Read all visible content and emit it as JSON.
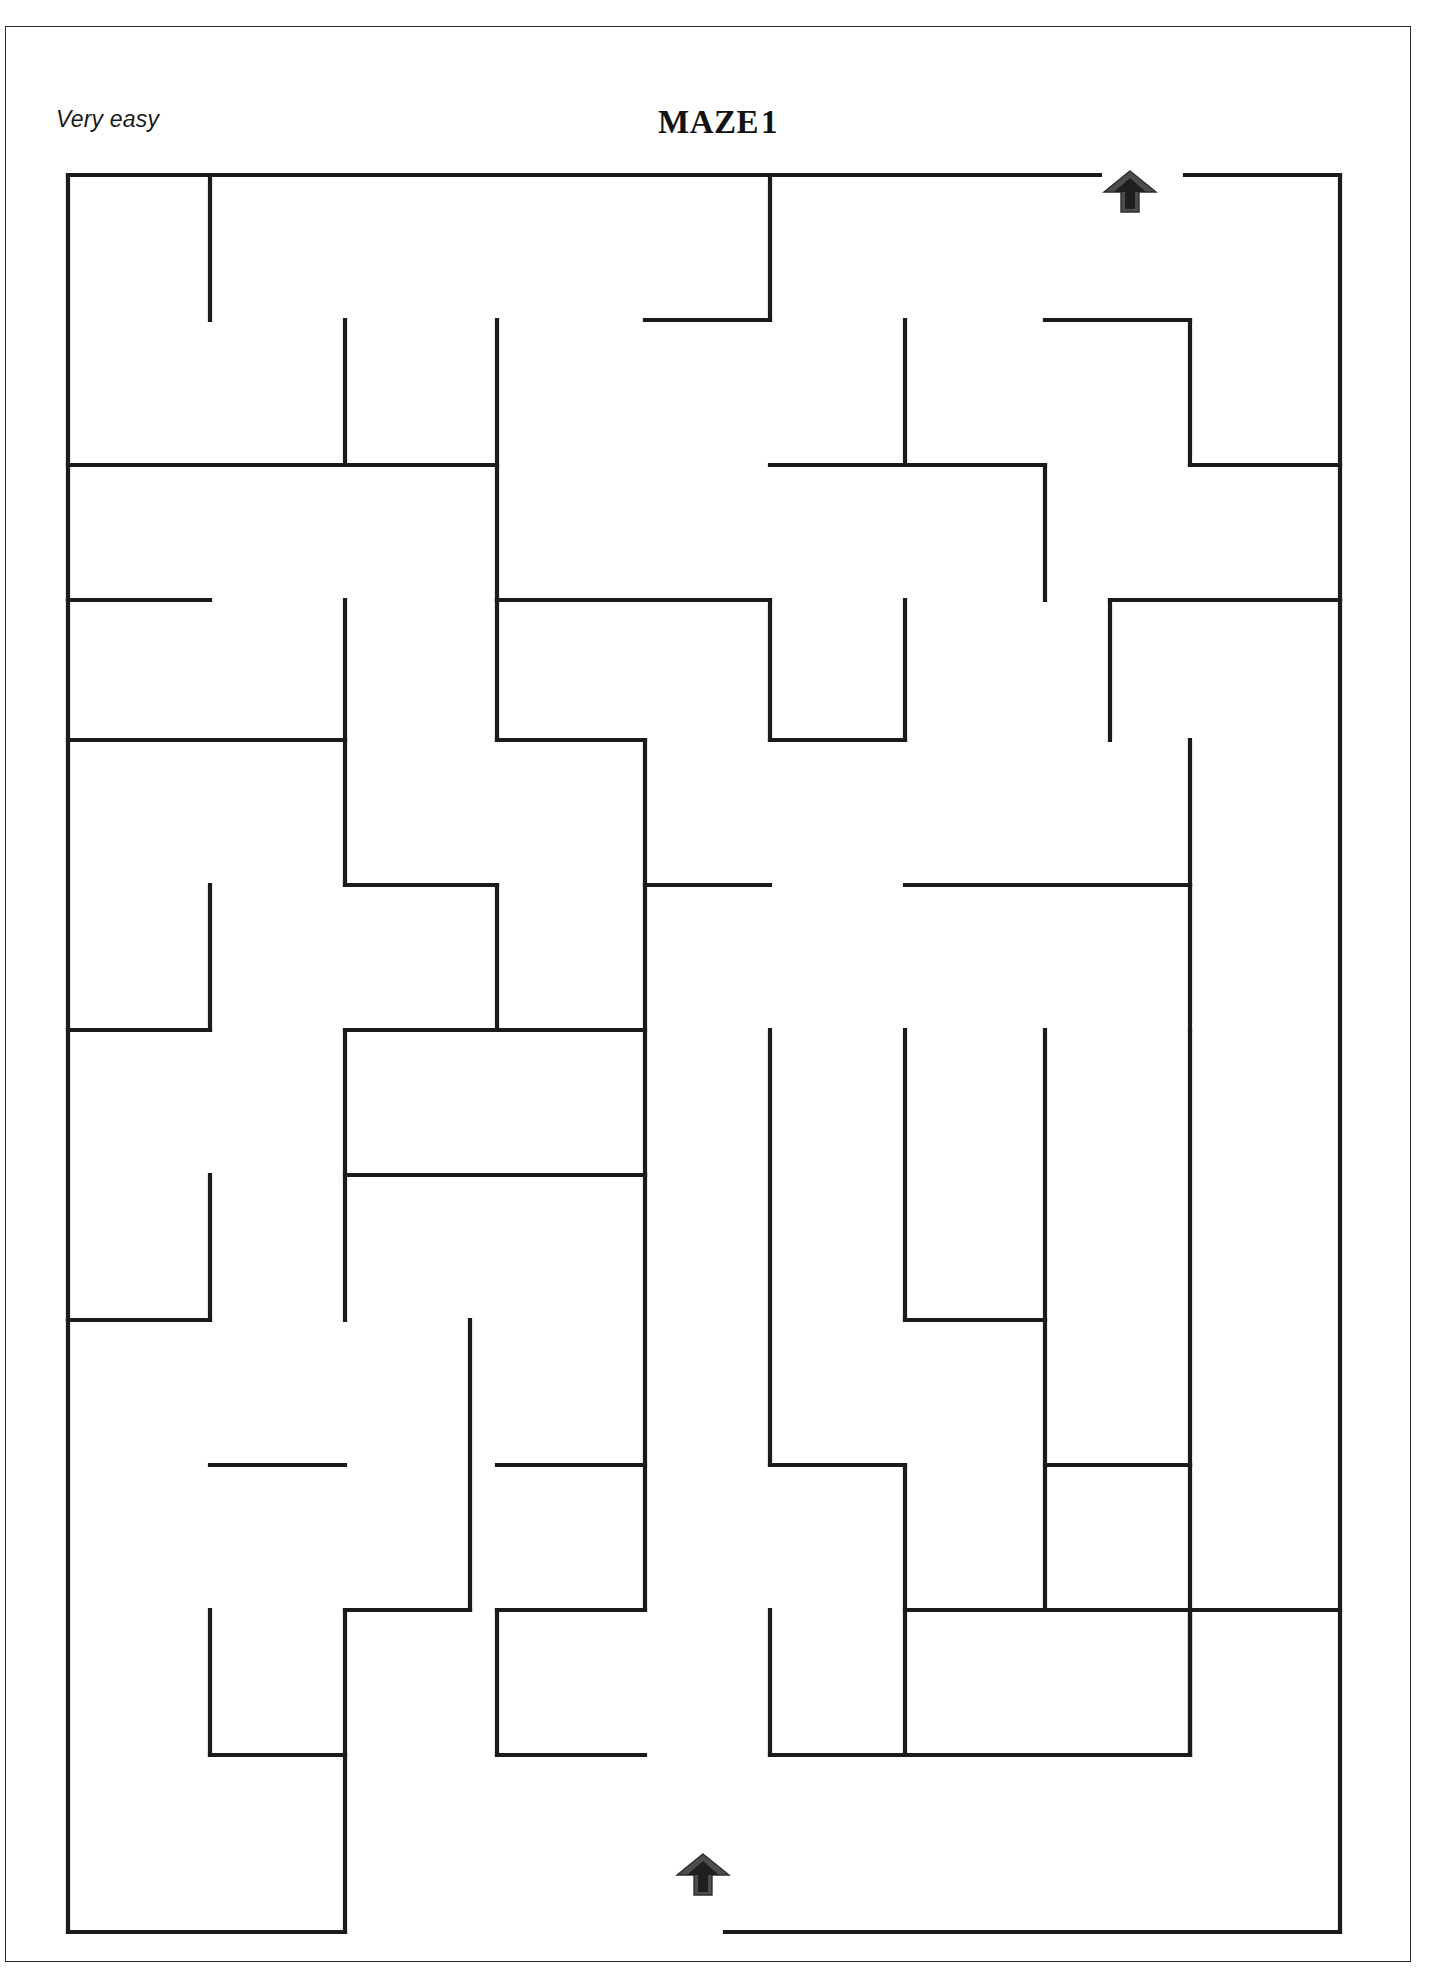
{
  "page": {
    "title": "MAZE",
    "title_number": "1",
    "difficulty": "Very easy",
    "background_color": "#ffffff",
    "frame_color": "#2b2b2b"
  },
  "maze": {
    "name": "maze-grid",
    "wall_color": "#1b1b1b",
    "grid_columns": 17,
    "grid_rows": 23,
    "bounds": {
      "x": 68,
      "y": 175,
      "width": 1272,
      "height": 1757
    },
    "entrance": {
      "name": "maze-entrance-arrow",
      "label": "entrance",
      "x": 1130,
      "y": 192,
      "direction": "up",
      "color": "#4d4d4d"
    },
    "exit": {
      "name": "maze-exit-arrow",
      "label": "exit",
      "x": 703,
      "y": 1875,
      "direction": "up",
      "color": "#4d4d4d"
    },
    "walls": [
      [
        68,
        175,
        68,
        1932
      ],
      [
        1340,
        175,
        1340,
        1932
      ],
      [
        68,
        175,
        1100,
        175
      ],
      [
        1185,
        175,
        1340,
        175
      ],
      [
        68,
        1932,
        345,
        1932
      ],
      [
        725,
        1932,
        1340,
        1932
      ],
      [
        210,
        175,
        210,
        320
      ],
      [
        770,
        175,
        770,
        320
      ],
      [
        645,
        320,
        770,
        320
      ],
      [
        497,
        320,
        497,
        600
      ],
      [
        345,
        320,
        345,
        465
      ],
      [
        68,
        465,
        497,
        465
      ],
      [
        905,
        320,
        905,
        465
      ],
      [
        770,
        465,
        1045,
        465
      ],
      [
        1045,
        465,
        1045,
        600
      ],
      [
        1045,
        320,
        1190,
        320
      ],
      [
        1190,
        320,
        1190,
        465
      ],
      [
        1190,
        465,
        1340,
        465
      ],
      [
        68,
        600,
        210,
        600
      ],
      [
        497,
        600,
        770,
        600
      ],
      [
        1110,
        600,
        1340,
        600
      ],
      [
        1110,
        600,
        1110,
        740
      ],
      [
        345,
        600,
        345,
        740
      ],
      [
        497,
        600,
        497,
        740
      ],
      [
        770,
        600,
        770,
        740
      ],
      [
        905,
        600,
        905,
        740
      ],
      [
        497,
        740,
        645,
        740
      ],
      [
        770,
        740,
        905,
        740
      ],
      [
        68,
        740,
        345,
        740
      ],
      [
        345,
        740,
        345,
        885
      ],
      [
        1190,
        740,
        1190,
        885
      ],
      [
        645,
        740,
        645,
        1175
      ],
      [
        210,
        885,
        210,
        1030
      ],
      [
        345,
        885,
        497,
        885
      ],
      [
        497,
        885,
        497,
        1030
      ],
      [
        645,
        885,
        770,
        885
      ],
      [
        905,
        885,
        1190,
        885
      ],
      [
        1190,
        885,
        1190,
        1030
      ],
      [
        68,
        1030,
        210,
        1030
      ],
      [
        345,
        1030,
        645,
        1030
      ],
      [
        345,
        1030,
        345,
        1320
      ],
      [
        770,
        1030,
        770,
        1465
      ],
      [
        905,
        1030,
        905,
        1320
      ],
      [
        1045,
        1030,
        1045,
        1610
      ],
      [
        345,
        1175,
        645,
        1175
      ],
      [
        1190,
        1030,
        1190,
        1465
      ],
      [
        210,
        1175,
        210,
        1320
      ],
      [
        68,
        1320,
        210,
        1320
      ],
      [
        905,
        1320,
        1045,
        1320
      ],
      [
        470,
        1320,
        470,
        1610
      ],
      [
        645,
        1175,
        645,
        1610
      ],
      [
        210,
        1465,
        345,
        1465
      ],
      [
        497,
        1465,
        645,
        1465
      ],
      [
        770,
        1465,
        905,
        1465
      ],
      [
        1045,
        1465,
        1190,
        1465
      ],
      [
        497,
        1610,
        645,
        1610
      ],
      [
        905,
        1610,
        1045,
        1610
      ],
      [
        1045,
        1610,
        1340,
        1610
      ],
      [
        1190,
        1610,
        1190,
        1755
      ],
      [
        345,
        1610,
        470,
        1610
      ],
      [
        210,
        1610,
        210,
        1755
      ],
      [
        345,
        1610,
        345,
        1755
      ],
      [
        210,
        1755,
        345,
        1755
      ],
      [
        497,
        1755,
        645,
        1755
      ],
      [
        770,
        1755,
        1190,
        1755
      ],
      [
        905,
        1465,
        905,
        1755
      ],
      [
        345,
        1755,
        345,
        1932
      ],
      [
        497,
        1610,
        497,
        1755
      ],
      [
        770,
        1610,
        770,
        1755
      ],
      [
        1190,
        1465,
        1190,
        1755
      ]
    ]
  }
}
